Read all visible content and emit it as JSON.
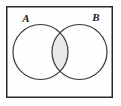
{
  "figure": {
    "name": "venn-diagram-two-sets-intersection",
    "universe_shape": "rectangle",
    "shaded_region": "A-intersect-B"
  },
  "labels": {
    "set_a": "A",
    "set_b": "B"
  },
  "colors": {
    "outline": "#2b2b2b",
    "circle_stroke": "#3a3a3a",
    "shade_fill": "#e9e8e6",
    "background": "#fefefe",
    "label_color": "#1a1a1a"
  },
  "geometry": {
    "rect": {
      "x": 6,
      "y": 6,
      "width": 107,
      "height": 92
    },
    "circle_a": {
      "cx": 40.5,
      "cy": 52,
      "r": 27.5
    },
    "circle_b": {
      "cx": 79.5,
      "cy": 52,
      "r": 27.5
    },
    "label_a_pos": {
      "x": 26,
      "y": 22
    },
    "label_b_pos": {
      "x": 96,
      "y": 21
    }
  }
}
